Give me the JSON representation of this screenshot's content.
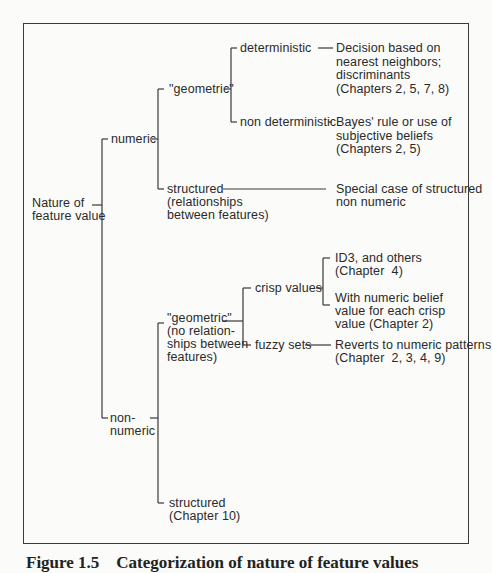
{
  "diagram": {
    "root": {
      "label": "Nature of\nfeature value"
    },
    "numeric": {
      "label": "numeric",
      "geometric": {
        "label": "\"geometric\"",
        "deterministic": {
          "label": "deterministic",
          "result": "Decision based on\nnearest neighbors;\ndiscriminants\n(Chapters 2, 5, 7, 8)"
        },
        "non_deterministic": {
          "label": "non deterministic",
          "result": "Bayes' rule or use of\nsubjective beliefs\n(Chapters 2, 5)"
        }
      },
      "structured": {
        "label": "structured\n(relationships\nbetween features)",
        "result": "Special case of structured\nnon numeric"
      }
    },
    "non_numeric": {
      "label": "non-\nnumeric",
      "geometric": {
        "label": "\"geometric\"\n(no relation-\nships between\nfeatures)",
        "crisp_values": {
          "label": "crisp values",
          "result_1": "ID3, and others\n(Chapter  4)",
          "result_2": "With numeric belief\nvalue for each crisp\nvalue (Chapter 2)"
        },
        "fuzzy_sets": {
          "label": "fuzzy sets",
          "result": "Reverts to numeric patterns\n(Chapter  2, 3, 4, 9)"
        }
      },
      "structured": {
        "label": "structured\n(Chapter 10)"
      }
    }
  },
  "caption": {
    "text": "Figure 1.5    Categorization of nature of feature values"
  },
  "colors": {
    "line": "#3a3a3a",
    "text": "#2a2a2a",
    "background": "#fbfbf9"
  }
}
